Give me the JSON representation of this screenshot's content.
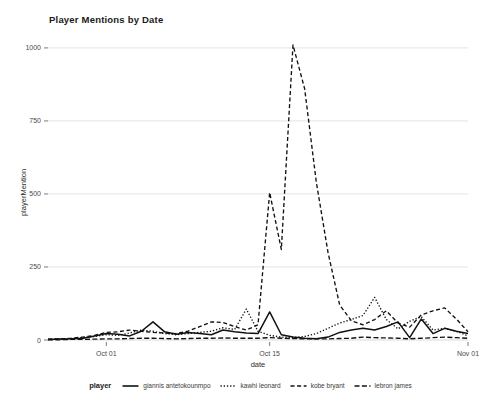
{
  "chart_data": {
    "type": "line",
    "title": "Player Mentions by Date",
    "xlabel": "date",
    "ylabel": "playerMention",
    "grid": true,
    "legend_position": "bottom",
    "legend_title": "player",
    "ylim": [
      0,
      1010
    ],
    "yticks": [
      0,
      250,
      500,
      750,
      1000
    ],
    "ytick_labels": [
      "0",
      "250",
      "500",
      "750",
      "1000"
    ],
    "xticks": [
      "Oct 01",
      "Oct 15",
      "Nov 01"
    ],
    "xtick_positions": [
      5,
      19,
      36
    ],
    "x": [
      0,
      1,
      2,
      3,
      4,
      5,
      6,
      7,
      8,
      9,
      10,
      11,
      12,
      13,
      14,
      15,
      16,
      17,
      18,
      19,
      20,
      21,
      22,
      23,
      24,
      25,
      26,
      27,
      28,
      29,
      30,
      31,
      32,
      33,
      34,
      35,
      36
    ],
    "x_labels": [
      "Sep 26",
      "Sep 27",
      "Sep 28",
      "Sep 29",
      "Sep 30",
      "Oct 01",
      "Oct 02",
      "Oct 03",
      "Oct 04",
      "Oct 05",
      "Oct 06",
      "Oct 07",
      "Oct 08",
      "Oct 09",
      "Oct 10",
      "Oct 11",
      "Oct 12",
      "Oct 13",
      "Oct 14",
      "Oct 15",
      "Oct 16",
      "Oct 17",
      "Oct 18",
      "Oct 19",
      "Oct 20",
      "Oct 21",
      "Oct 22",
      "Oct 23",
      "Oct 24",
      "Oct 25",
      "Oct 26",
      "Oct 27",
      "Oct 28",
      "Oct 29",
      "Oct 30",
      "Oct 31",
      "Nov 01"
    ],
    "series": [
      {
        "name": "giannis antetokounmpo",
        "dash": "solid",
        "color": "#111111",
        "values": [
          2,
          3,
          4,
          6,
          14,
          22,
          20,
          14,
          30,
          62,
          28,
          20,
          26,
          22,
          18,
          34,
          28,
          24,
          22,
          96,
          18,
          10,
          6,
          4,
          10,
          26,
          34,
          40,
          34,
          46,
          62,
          8,
          72,
          22,
          40,
          30,
          22
        ]
      },
      {
        "name": "kawhi leonard",
        "dash": "dotted",
        "color": "#111111",
        "values": [
          2,
          3,
          4,
          8,
          12,
          18,
          16,
          24,
          34,
          30,
          22,
          18,
          22,
          26,
          30,
          42,
          36,
          106,
          30,
          16,
          10,
          8,
          12,
          22,
          40,
          58,
          70,
          84,
          146,
          70,
          38,
          64,
          80,
          34,
          40,
          30,
          14
        ]
      },
      {
        "name": "kobe bryant",
        "dash": "dashed",
        "color": "#111111",
        "values": [
          3,
          4,
          6,
          10,
          16,
          26,
          28,
          34,
          30,
          26,
          24,
          22,
          30,
          46,
          62,
          60,
          46,
          34,
          52,
          505,
          310,
          1010,
          860,
          540,
          300,
          120,
          66,
          52,
          70,
          100,
          58,
          44,
          86,
          100,
          110,
          72,
          28
        ]
      },
      {
        "name": "lebron james",
        "dash": "dashdot",
        "color": "#111111",
        "values": [
          1,
          1,
          2,
          2,
          3,
          4,
          4,
          5,
          6,
          6,
          5,
          4,
          5,
          6,
          6,
          7,
          6,
          6,
          6,
          8,
          6,
          5,
          4,
          4,
          4,
          5,
          6,
          10,
          8,
          7,
          6,
          4,
          6,
          8,
          10,
          8,
          6
        ]
      }
    ]
  }
}
